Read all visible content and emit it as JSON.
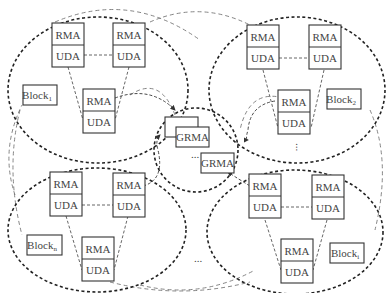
{
  "diagram": {
    "type": "distributed-agent-architecture",
    "center": {
      "labels": [
        "GRMA",
        "GRMA"
      ],
      "ellipsis": "..."
    },
    "blocks": [
      {
        "id": "block-1",
        "label": "Block",
        "subscript": "1",
        "position": "top-left",
        "agents": [
          {
            "top": "RMA",
            "bottom": "UDA"
          },
          {
            "top": "RMA",
            "bottom": "UDA"
          },
          {
            "top": "RMA",
            "bottom": "UDA"
          }
        ]
      },
      {
        "id": "block-2",
        "label": "Block",
        "subscript": "2",
        "position": "top-right",
        "agents": [
          {
            "top": "RMA",
            "bottom": "UDA"
          },
          {
            "top": "RMA",
            "bottom": "UDA"
          },
          {
            "top": "RMA",
            "bottom": "UDA"
          }
        ]
      },
      {
        "id": "block-n",
        "label": "Block",
        "subscript": "n",
        "position": "bottom-left",
        "agents": [
          {
            "top": "RMA",
            "bottom": "UDA"
          },
          {
            "top": "RMA",
            "bottom": "UDA"
          },
          {
            "top": "RMA",
            "bottom": "UDA"
          }
        ]
      },
      {
        "id": "block-i",
        "label": "Block",
        "subscript": "i",
        "position": "bottom-right",
        "agents": [
          {
            "top": "RMA",
            "bottom": "UDA"
          },
          {
            "top": "RMA",
            "bottom": "UDA"
          },
          {
            "top": "RMA",
            "bottom": "UDA"
          }
        ]
      }
    ],
    "ellipses_between_blocks": {
      "right": "...",
      "bottom": "..."
    }
  }
}
